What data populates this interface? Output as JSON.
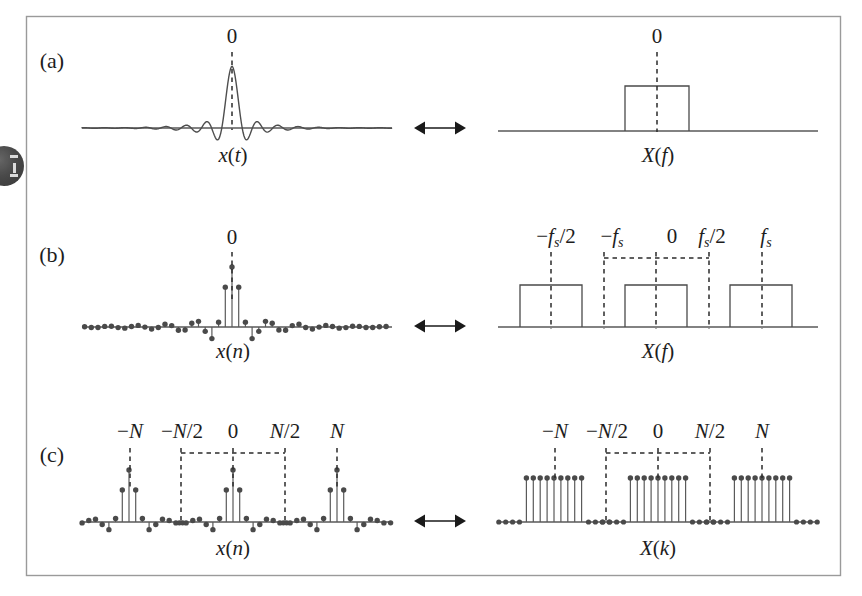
{
  "figure": {
    "caption_tags": [
      "(a)",
      "(b)",
      "(c)"
    ],
    "frame": {
      "x": 26,
      "y": 16,
      "width": 814,
      "height": 559,
      "color": "#9a9a9a"
    },
    "background": "#ffffff",
    "watermark": {
      "name": "circular-badge-watermark",
      "visible": true
    }
  },
  "colors": {
    "ink": "#1d1d1d",
    "curve": "#4e4e4e",
    "axis": "#585858",
    "stem": "#5a5a5a",
    "dot": "#4a4a4a",
    "dashed": "#2b2b2b",
    "frame": "#9a9a9a"
  },
  "panels": [
    {
      "tag": "(a)",
      "tag_pos": {
        "x": 52,
        "y": 68
      },
      "left": {
        "name": "continuous-time-sinc",
        "signal_label": "x(t)",
        "signal_label_pos": {
          "x": 233,
          "y": 162
        },
        "origin_label": "0",
        "origin_label_pos": {
          "x": 232,
          "y": 43
        },
        "axis": {
          "x1": 82,
          "x2": 392,
          "y": 128
        },
        "dashed_marker": {
          "x": 232,
          "y_top": 52,
          "y_bottom": 130
        }
      },
      "right": {
        "name": "continuous-spectrum-rect",
        "signal_label": "X(f)",
        "signal_label_pos": {
          "x": 658,
          "y": 162
        },
        "origin_label": "0",
        "origin_label_pos": {
          "x": 657,
          "y": 43
        },
        "axis": {
          "x1": 498,
          "x2": 818,
          "y": 131
        },
        "rect": {
          "x": 625,
          "y": 86,
          "width": 64,
          "height": 45
        },
        "dashed_marker": {
          "x": 657,
          "y_top": 52,
          "y_bottom": 132
        }
      },
      "arrow": {
        "name": "double-arrow",
        "x1": 414,
        "x2": 466,
        "y": 128
      }
    },
    {
      "tag": "(b)",
      "tag_pos": {
        "x": 52,
        "y": 262
      },
      "left": {
        "name": "sampled-time-sequence",
        "signal_label": "x(n)",
        "signal_label_pos": {
          "x": 233,
          "y": 358
        },
        "origin_label": "0",
        "origin_label_pos": {
          "x": 232,
          "y": 244
        },
        "axis": {
          "x1": 82,
          "x2": 392,
          "y": 327
        },
        "dashed_marker": {
          "x": 232,
          "y_top": 252,
          "y_bottom": 300
        },
        "sample_count": 47
      },
      "right": {
        "name": "periodic-spectrum-rects",
        "signal_label": "X(f)",
        "signal_label_pos": {
          "x": 658,
          "y": 358
        },
        "axis": {
          "x1": 498,
          "x2": 818,
          "y": 327
        },
        "tick_labels": [
          {
            "text": "-f_s",
            "display": "−f",
            "sub": "s",
            "x": 612,
            "y": 243
          },
          {
            "text": "-f_s/2",
            "display": "−f",
            "sub": "s",
            "suffix": "/2",
            "x": 556,
            "y": 243
          },
          {
            "text": "0",
            "display": "0",
            "x": 672,
            "y": 243
          },
          {
            "text": "f_s/2",
            "display": "f",
            "sub": "s",
            "suffix": "/2",
            "x": 712,
            "y": 243
          },
          {
            "text": "f_s",
            "display": "f",
            "sub": "s",
            "x": 766,
            "y": 243
          }
        ],
        "rects": [
          {
            "x": 520,
            "y": 285,
            "width": 62,
            "height": 42
          },
          {
            "x": 625,
            "y": 285,
            "width": 62,
            "height": 42
          },
          {
            "x": 730,
            "y": 285,
            "width": 62,
            "height": 42
          }
        ],
        "dashed_verticals": [
          {
            "x": 551,
            "y_top": 252,
            "y_bottom": 329
          },
          {
            "x": 604,
            "y_top": 252,
            "y_bottom": 329
          },
          {
            "x": 656,
            "y_top": 252,
            "y_bottom": 329
          },
          {
            "x": 709,
            "y_top": 252,
            "y_bottom": 329
          },
          {
            "x": 762,
            "y_top": 252,
            "y_bottom": 329
          }
        ],
        "dashed_bracket": {
          "x1": 604,
          "x2": 709,
          "y": 258
        }
      },
      "arrow": {
        "name": "double-arrow",
        "x1": 414,
        "x2": 466,
        "y": 326
      }
    },
    {
      "tag": "(c)",
      "tag_pos": {
        "x": 52,
        "y": 462
      },
      "left": {
        "name": "dft-time-sequence-periodic",
        "signal_label": "x(n)",
        "signal_label_pos": {
          "x": 233,
          "y": 555
        },
        "axis": {
          "x1": 82,
          "x2": 392,
          "y": 522
        },
        "tick_labels": [
          {
            "text": "-N",
            "x": 130,
            "y": 438
          },
          {
            "text": "-N/2",
            "x": 182,
            "y": 438
          },
          {
            "text": "0",
            "x": 233,
            "y": 438
          },
          {
            "text": "N/2",
            "x": 285,
            "y": 438
          },
          {
            "text": "N",
            "x": 337,
            "y": 438
          }
        ],
        "dashed_verticals": [
          {
            "x": 130,
            "y_top": 448,
            "y_bottom": 490
          },
          {
            "x": 181,
            "y_top": 448,
            "y_bottom": 524
          },
          {
            "x": 233,
            "y_top": 448,
            "y_bottom": 490
          },
          {
            "x": 285,
            "y_top": 448,
            "y_bottom": 524
          },
          {
            "x": 337,
            "y_top": 448,
            "y_bottom": 490
          }
        ],
        "dashed_bracket": {
          "x1": 181,
          "x2": 285,
          "y": 453
        },
        "period": 104
      },
      "right": {
        "name": "dft-spectrum-periodic",
        "signal_label": "X(k)",
        "signal_label_pos": {
          "x": 658,
          "y": 555
        },
        "axis": {
          "x1": 498,
          "x2": 818,
          "y": 522
        },
        "tick_labels": [
          {
            "text": "-N",
            "x": 555,
            "y": 438
          },
          {
            "text": "-N/2",
            "x": 607,
            "y": 438
          },
          {
            "text": "0",
            "x": 658,
            "y": 438
          },
          {
            "text": "N/2",
            "x": 710,
            "y": 438
          },
          {
            "text": "N",
            "x": 762,
            "y": 438
          }
        ],
        "dashed_verticals": [
          {
            "x": 555,
            "y_top": 448,
            "y_bottom": 480
          },
          {
            "x": 606,
            "y_top": 448,
            "y_bottom": 524
          },
          {
            "x": 658,
            "y_top": 448,
            "y_bottom": 480
          },
          {
            "x": 710,
            "y_top": 448,
            "y_bottom": 524
          },
          {
            "x": 762,
            "y_top": 448,
            "y_bottom": 480
          }
        ],
        "dashed_bracket": {
          "x1": 606,
          "x2": 710,
          "y": 453
        },
        "block_stem_count": 9,
        "period": 104
      },
      "arrow": {
        "name": "double-arrow",
        "x1": 414,
        "x2": 466,
        "y": 521
      }
    }
  ],
  "chart_data": {
    "type": "line",
    "xlabel": "",
    "ylabel": "",
    "subplots": [
      {
        "id": "a-left",
        "type": "line",
        "label": "x(t)",
        "description": "Continuous-time sinc pulse centred at 0",
        "annotations": [
          "0"
        ],
        "function": "sinc",
        "peak_x": 0,
        "peak_value": 1.0,
        "x_range": [
          -11,
          11
        ]
      },
      {
        "id": "a-right",
        "type": "bar",
        "label": "X(f)",
        "description": "Single rectangular (brick-wall) spectrum centred at f=0",
        "annotations": [
          "0"
        ],
        "categories": [
          "0"
        ],
        "values": [
          1.0
        ]
      },
      {
        "id": "b-left",
        "type": "scatter",
        "label": "x(n)",
        "description": "Sampled sinc sequence (stem plot) centred at n=0",
        "annotations": [
          "0"
        ],
        "x": [
          -23,
          -22,
          -21,
          -20,
          -19,
          -18,
          -17,
          -16,
          -15,
          -14,
          -13,
          -12,
          -11,
          -10,
          -9,
          -8,
          -7,
          -6,
          -5,
          -4,
          -3,
          -2,
          -1,
          0,
          1,
          2,
          3,
          4,
          5,
          6,
          7,
          8,
          9,
          10,
          11,
          12,
          13,
          14,
          15,
          16,
          17,
          18,
          19,
          20,
          21,
          22,
          23
        ],
        "values": [
          0.02,
          -0.03,
          0.04,
          -0.04,
          0.03,
          -0.02,
          0.04,
          -0.05,
          0.05,
          -0.03,
          0.03,
          -0.05,
          0.06,
          -0.06,
          0.05,
          -0.04,
          0.06,
          -0.08,
          0.09,
          -0.09,
          0.07,
          -0.13,
          0.22,
          1.0,
          0.55,
          -0.12,
          0.1,
          -0.09,
          0.08,
          -0.07,
          0.06,
          -0.05,
          0.05,
          -0.04,
          0.04,
          -0.04,
          0.03,
          -0.03,
          0.03,
          -0.03,
          0.03,
          -0.02,
          0.02,
          -0.02,
          0.02,
          -0.02,
          0.02
        ]
      },
      {
        "id": "b-right",
        "type": "bar",
        "label": "X(f)",
        "description": "Periodic rectangular spectrum replicated at multiples of fs",
        "annotations": [
          "−fₛ",
          "−fₛ/2",
          "0",
          "fₛ/2",
          "fₛ"
        ],
        "categories": [
          "-fs",
          "0",
          "+fs"
        ],
        "values": [
          1.0,
          1.0,
          1.0
        ]
      },
      {
        "id": "c-left",
        "type": "scatter",
        "label": "x(n)",
        "description": "Periodically extended sampled sinc sequence, period N",
        "annotations": [
          "−N",
          "−N/2",
          "0",
          "N/2",
          "N"
        ],
        "period": "N"
      },
      {
        "id": "c-right",
        "type": "scatter",
        "label": "X(k)",
        "description": "Periodic discrete spectrum (DFT), 9 non-zero samples per period, period N",
        "annotations": [
          "−N",
          "−N/2",
          "0",
          "N/2",
          "N"
        ],
        "period": "N",
        "nonzero_per_period": 9,
        "nonzero_value": 1.0
      }
    ]
  }
}
